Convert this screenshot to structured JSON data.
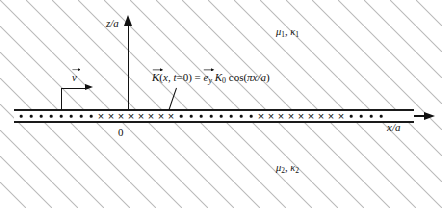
{
  "figure": {
    "type": "physics-schematic",
    "background": "hatched",
    "hatch_color": "#b9b9b9",
    "ink_color": "#111111"
  },
  "axes": {
    "vertical": {
      "label": "z/a",
      "direction": "up",
      "origin_tick": "0"
    },
    "horizontal": {
      "label": "x/a",
      "direction": "right"
    },
    "origin_label": "0"
  },
  "regions": {
    "upper": {
      "label": "μ₁, κ₁",
      "mu": "μ",
      "mu_sub": "1",
      "kappa": "κ",
      "kappa_sub": "1"
    },
    "lower": {
      "label": "μ₂, κ₂",
      "mu": "μ",
      "mu_sub": "2",
      "kappa": "κ",
      "kappa_sub": "2"
    }
  },
  "velocity": {
    "label": "v",
    "vector_label": "v⃗",
    "direction": "right"
  },
  "current_sheet": {
    "formula_plain": "K(x, t=0) = e_y K_0 cos(πx/a)",
    "formula_parts": {
      "K": "K",
      "arg": "(x, t=0) = ",
      "e": "e",
      "e_sub": "y",
      "K0": "K",
      "K0_sub": "0",
      "cos": "cos(",
      "pi": "π",
      "x": "x",
      "over_a": "/a)"
    },
    "symbols": {
      "dot": "•",
      "cross": "×",
      "dot_meaning": "current out of page (+y)",
      "cross_meaning": "current into page (−y)"
    },
    "pattern": [
      {
        "symbol": "dot",
        "x": 21
      },
      {
        "symbol": "dot",
        "x": 31
      },
      {
        "symbol": "dot",
        "x": 41
      },
      {
        "symbol": "dot",
        "x": 51
      },
      {
        "symbol": "dot",
        "x": 61
      },
      {
        "symbol": "dot",
        "x": 71
      },
      {
        "symbol": "dot",
        "x": 81
      },
      {
        "symbol": "dot",
        "x": 91
      },
      {
        "symbol": "cross",
        "x": 101
      },
      {
        "symbol": "cross",
        "x": 111
      },
      {
        "symbol": "cross",
        "x": 121
      },
      {
        "symbol": "cross",
        "x": 131
      },
      {
        "symbol": "cross",
        "x": 141
      },
      {
        "symbol": "cross",
        "x": 151
      },
      {
        "symbol": "cross",
        "x": 161
      },
      {
        "symbol": "cross",
        "x": 171
      },
      {
        "symbol": "dot",
        "x": 181
      },
      {
        "symbol": "dot",
        "x": 191
      },
      {
        "symbol": "dot",
        "x": 201
      },
      {
        "symbol": "dot",
        "x": 211
      },
      {
        "symbol": "dot",
        "x": 221
      },
      {
        "symbol": "dot",
        "x": 231
      },
      {
        "symbol": "dot",
        "x": 241
      },
      {
        "symbol": "dot",
        "x": 251
      },
      {
        "symbol": "cross",
        "x": 261
      },
      {
        "symbol": "cross",
        "x": 271
      },
      {
        "symbol": "cross",
        "x": 281
      },
      {
        "symbol": "cross",
        "x": 291
      },
      {
        "symbol": "cross",
        "x": 301
      },
      {
        "symbol": "cross",
        "x": 311
      },
      {
        "symbol": "cross",
        "x": 321
      },
      {
        "symbol": "cross",
        "x": 331
      },
      {
        "symbol": "cross",
        "x": 341
      },
      {
        "symbol": "dot",
        "x": 351
      },
      {
        "symbol": "dot",
        "x": 361
      },
      {
        "symbol": "dot",
        "x": 371
      },
      {
        "symbol": "dot",
        "x": 381
      }
    ]
  }
}
